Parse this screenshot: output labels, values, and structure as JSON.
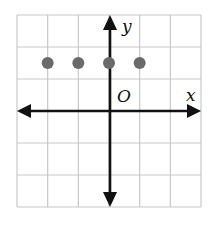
{
  "diagram": {
    "type": "coordinate-grid",
    "grid": {
      "cols": 6,
      "rows": 6,
      "x_min": -3,
      "x_max": 3,
      "y_min": -3,
      "y_max": 3,
      "line_color": "#c8c8c8"
    },
    "axes": {
      "x_label": "x",
      "y_label": "y",
      "origin_label": "O",
      "color": "#111111"
    },
    "points": [
      {
        "x": -2,
        "y": 1.5
      },
      {
        "x": -1,
        "y": 1.5
      },
      {
        "x": 0,
        "y": 1.5
      },
      {
        "x": 1,
        "y": 1.5
      }
    ],
    "point_color": "#6a6a6a"
  }
}
